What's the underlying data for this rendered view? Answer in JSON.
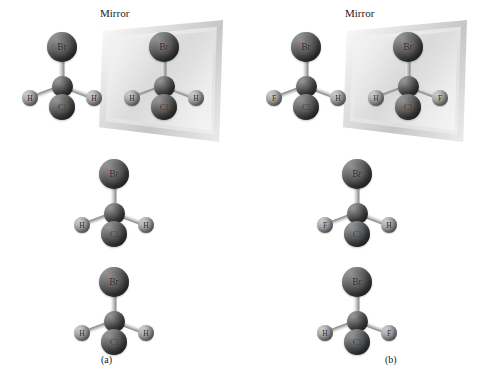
{
  "figure": {
    "background_color": "#ffffff",
    "atom_dark_color": "#585858",
    "atom_light_color": "#9a9a9a",
    "bond_color": "#bdbdbd"
  },
  "panels": [
    {
      "id": "a",
      "caption": "(a)",
      "mirror_label": "Mirror",
      "molecules": [
        {
          "name": "original-molecule-a",
          "atoms": {
            "top": "Br",
            "left": "H",
            "bottom": "Cl",
            "right": "H"
          }
        },
        {
          "name": "mirror-image-molecule-a",
          "atoms": {
            "top": "Br",
            "left": "H",
            "bottom": "Cl",
            "right": "H"
          }
        },
        {
          "name": "rotated-molecule-a",
          "atoms": {
            "top": "Br",
            "left": "H",
            "bottom": "Cl",
            "right": "H"
          }
        },
        {
          "name": "superimposed-molecule-a",
          "atoms": {
            "top": "Br",
            "left": "H",
            "bottom": "Cl",
            "right": "H"
          }
        }
      ]
    },
    {
      "id": "b",
      "caption": "(b)",
      "mirror_label": "Mirror",
      "molecules": [
        {
          "name": "original-molecule-b",
          "atoms": {
            "top": "Br",
            "left": "F",
            "bottom": "Cl",
            "right": "H"
          }
        },
        {
          "name": "mirror-image-molecule-b",
          "atoms": {
            "top": "Br",
            "left": "H",
            "bottom": "Cl",
            "right": "F"
          }
        },
        {
          "name": "rotated-molecule-b",
          "atoms": {
            "top": "Br",
            "left": "F",
            "bottom": "Cl",
            "right": "H"
          }
        },
        {
          "name": "non-superimposed-molecule-b",
          "atoms": {
            "top": "Br",
            "left": "H",
            "bottom": "Cl",
            "right": "F"
          }
        }
      ]
    }
  ]
}
